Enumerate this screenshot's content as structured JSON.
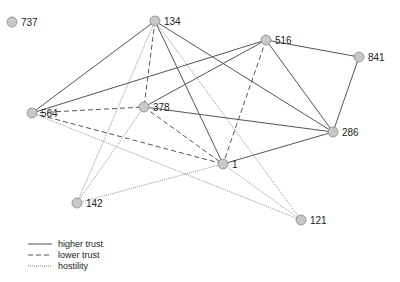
{
  "nodes": [
    {
      "id": "737",
      "x": 12,
      "y": 22
    },
    {
      "id": "134",
      "x": 155,
      "y": 21
    },
    {
      "id": "516",
      "x": 266,
      "y": 40
    },
    {
      "id": "841",
      "x": 359,
      "y": 57
    },
    {
      "id": "564",
      "x": 32,
      "y": 113
    },
    {
      "id": "378",
      "x": 144,
      "y": 107
    },
    {
      "id": "286",
      "x": 333,
      "y": 132
    },
    {
      "id": "1",
      "x": 223,
      "y": 164
    },
    {
      "id": "142",
      "x": 77,
      "y": 203
    },
    {
      "id": "121",
      "x": 301,
      "y": 220
    }
  ],
  "edges": [
    {
      "from": "134",
      "to": "564",
      "type": "higher"
    },
    {
      "from": "134",
      "to": "378",
      "type": "lower"
    },
    {
      "from": "134",
      "to": "1",
      "type": "higher"
    },
    {
      "from": "134",
      "to": "286",
      "type": "higher"
    },
    {
      "from": "134",
      "to": "142",
      "type": "hostility"
    },
    {
      "from": "134",
      "to": "121",
      "type": "hostility"
    },
    {
      "from": "516",
      "to": "564",
      "type": "higher"
    },
    {
      "from": "516",
      "to": "378",
      "type": "higher"
    },
    {
      "from": "516",
      "to": "1",
      "type": "lower"
    },
    {
      "from": "516",
      "to": "286",
      "type": "higher"
    },
    {
      "from": "516",
      "to": "841",
      "type": "higher"
    },
    {
      "from": "841",
      "to": "286",
      "type": "higher"
    },
    {
      "from": "564",
      "to": "378",
      "type": "lower"
    },
    {
      "from": "564",
      "to": "1",
      "type": "lower"
    },
    {
      "from": "564",
      "to": "121",
      "type": "hostility"
    },
    {
      "from": "378",
      "to": "286",
      "type": "higher"
    },
    {
      "from": "378",
      "to": "1",
      "type": "lower"
    },
    {
      "from": "378",
      "to": "142",
      "type": "hostility"
    },
    {
      "from": "286",
      "to": "1",
      "type": "higher"
    },
    {
      "from": "1",
      "to": "142",
      "type": "hostility"
    },
    {
      "from": "1",
      "to": "121",
      "type": "hostility"
    }
  ],
  "legend": [
    {
      "type": "higher",
      "label": "higher trust"
    },
    {
      "type": "lower",
      "label": "lower trust"
    },
    {
      "type": "hostility",
      "label": "hostility"
    }
  ],
  "colors": {
    "node_fill": "#c8c8c8",
    "node_stroke": "#888888",
    "edge": "#555555",
    "hostility_edge": "#777777"
  }
}
